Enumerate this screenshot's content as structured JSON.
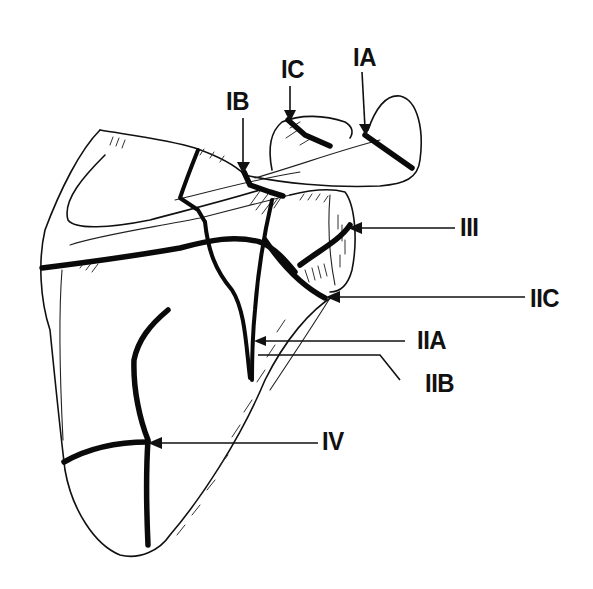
{
  "diagram": {
    "labels": {
      "IA": "IA",
      "IB": "IB",
      "IC": "IC",
      "IIA": "IIA",
      "IIB": "IIB",
      "IIC": "IIC",
      "III": "III",
      "IV": "IV"
    },
    "colors": {
      "background": "#ffffff",
      "ink": "#111111"
    }
  }
}
